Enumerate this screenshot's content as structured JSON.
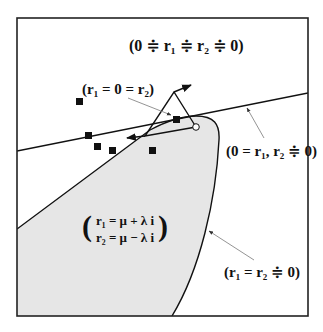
{
  "diagram": {
    "type": "phase-region-diagram",
    "colors": {
      "frame": "#222222",
      "shaded_region": "#e6e6e6",
      "line": "#111111",
      "pointer": "#888888"
    },
    "labels": {
      "top": "(0 ≑ r₁ ≑ r₂ ≑ 0)",
      "double_zero": "(r₁ = 0 = r₂)",
      "line_label": "(0 = r₁, r₂ ≑ 0)",
      "curve_label": "(r₁ = r₂ ≑ 0)",
      "complex_row1": "r₁ = μ + λ i",
      "complex_row2": "r₂ = μ − λ i",
      "paren_open": "(",
      "paren_close": ")"
    },
    "markers": [
      {
        "x": 79,
        "y": 101
      },
      {
        "x": 88,
        "y": 135
      },
      {
        "x": 97,
        "y": 146
      },
      {
        "x": 112,
        "y": 150
      },
      {
        "x": 152,
        "y": 150
      },
      {
        "x": 176,
        "y": 119
      }
    ]
  }
}
